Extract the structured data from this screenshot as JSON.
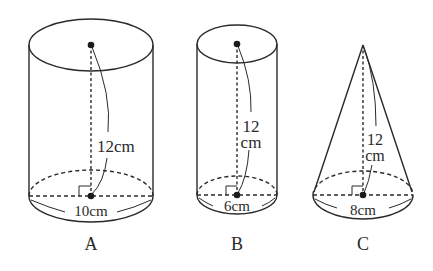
{
  "figure": {
    "stroke_color": "#2a2a2a",
    "background": "#ffffff"
  },
  "solids": [
    {
      "id": "A",
      "type": "cylinder",
      "label": "A",
      "height_label": "12cm",
      "diameter_label": "10cm"
    },
    {
      "id": "B",
      "type": "cylinder",
      "label": "B",
      "height_label_line1": "12",
      "height_label_line2": "cm",
      "diameter_label": "6cm"
    },
    {
      "id": "C",
      "type": "cone",
      "label": "C",
      "height_label_line1": "12",
      "height_label_line2": "cm",
      "diameter_label": "8cm"
    }
  ]
}
